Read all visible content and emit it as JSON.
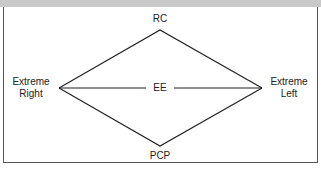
{
  "diagram": {
    "nodes": {
      "top": "RC",
      "bottom": "PCP",
      "left_line1": "Extreme",
      "left_line2": "Right",
      "right_line1": "Extreme",
      "right_line2": "Left",
      "center": "EE"
    },
    "colors": {
      "line": "#222222",
      "border": "#555555",
      "band": "#c9c9c9"
    }
  }
}
